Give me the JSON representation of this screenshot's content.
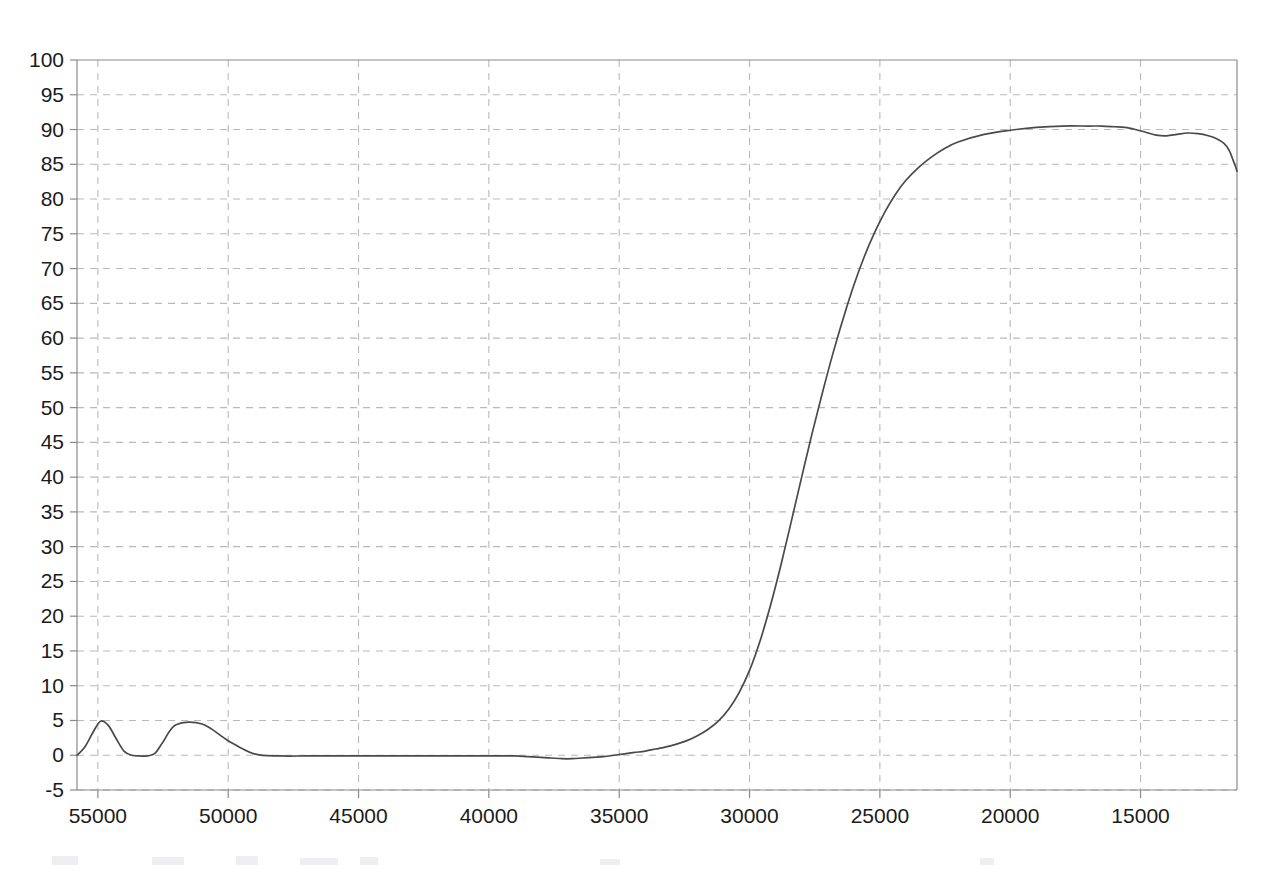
{
  "chart_data": {
    "type": "line",
    "title": "",
    "subtitle": "",
    "xlabel": "",
    "ylabel": "",
    "xlim": [
      55800,
      11300
    ],
    "ylim": [
      -5,
      100
    ],
    "x_axis_reversed": true,
    "grid": true,
    "legend": null,
    "x_ticks": [
      55000,
      50000,
      45000,
      40000,
      35000,
      30000,
      25000,
      20000,
      15000
    ],
    "x_tick_labels": [
      "55000",
      "50000",
      "45000",
      "40000",
      "35000",
      "30000",
      "25000",
      "20000",
      "15000"
    ],
    "y_ticks": [
      -5,
      0,
      5,
      10,
      15,
      20,
      25,
      30,
      35,
      40,
      45,
      50,
      55,
      60,
      65,
      70,
      75,
      80,
      85,
      90,
      95,
      100
    ],
    "y_tick_labels": [
      "-5",
      "0",
      "5",
      "10",
      "15",
      "20",
      "25",
      "30",
      "35",
      "40",
      "45",
      "50",
      "55",
      "60",
      "65",
      "70",
      "75",
      "80",
      "85",
      "90",
      "95",
      "100"
    ],
    "series": [
      {
        "name": "transmittance",
        "color": "#4a4a4a",
        "x": [
          55800,
          55500,
          55200,
          54900,
          54600,
          54300,
          54000,
          53700,
          53400,
          53100,
          52800,
          52500,
          52000,
          51000,
          50000,
          49000,
          48000,
          47000,
          46000,
          45000,
          44000,
          43000,
          42000,
          41000,
          40000,
          39000,
          38500,
          38000,
          37600,
          37200,
          36800,
          36400,
          36000,
          35600,
          35200,
          34800,
          34400,
          34000,
          33600,
          33200,
          32800,
          32400,
          32000,
          31600,
          31200,
          30800,
          30400,
          30000,
          29600,
          29200,
          28800,
          28400,
          28000,
          27600,
          27200,
          26800,
          26400,
          26000,
          25600,
          25200,
          24800,
          24400,
          24000,
          23500,
          23000,
          22500,
          22000,
          21000,
          20000,
          19000,
          18000,
          17000,
          16500,
          16000,
          15600,
          15200,
          14800,
          14400,
          14000,
          13600,
          13200,
          12800,
          12400,
          12100,
          11800,
          11600,
          11450,
          11350,
          11300
        ],
        "y": [
          0.0,
          1.2,
          3.2,
          4.9,
          4.3,
          2.4,
          0.6,
          0.0,
          -0.1,
          -0.1,
          0.3,
          1.9,
          4.4,
          4.5,
          2.1,
          0.2,
          -0.1,
          -0.1,
          -0.1,
          -0.1,
          -0.1,
          -0.1,
          -0.1,
          -0.1,
          -0.1,
          -0.1,
          -0.2,
          -0.3,
          -0.4,
          -0.5,
          -0.5,
          -0.4,
          -0.3,
          -0.2,
          0.0,
          0.2,
          0.4,
          0.6,
          0.9,
          1.2,
          1.6,
          2.1,
          2.8,
          3.7,
          4.9,
          6.6,
          9.0,
          12.2,
          16.4,
          21.5,
          27.3,
          33.6,
          40.0,
          46.3,
          52.2,
          57.8,
          62.9,
          67.6,
          71.7,
          75.2,
          78.2,
          80.7,
          82.7,
          84.6,
          86.1,
          87.3,
          88.2,
          89.3,
          89.9,
          90.3,
          90.5,
          90.5,
          90.5,
          90.4,
          90.3,
          90.0,
          89.6,
          89.2,
          89.1,
          89.3,
          89.5,
          89.4,
          89.1,
          88.7,
          88.0,
          87.0,
          85.6,
          84.6,
          84.0
        ]
      }
    ],
    "annotations": [],
    "plateau_value": 90.5,
    "baseline_value": 0,
    "noise_spikes": [
      {
        "x": 55000,
        "peak": 4.9
      },
      {
        "x": 52000,
        "peak": 4.5
      }
    ]
  },
  "axis_colors": {
    "axis": "#8a8a8a",
    "grid": "#b9b9bd",
    "curve": "#4a4a4a",
    "text": "#1b1b1b",
    "background": "#ffffff"
  }
}
